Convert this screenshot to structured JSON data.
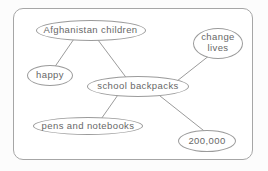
{
  "diagram": {
    "colors": {
      "card_background": "#ffffff",
      "card_border": "#a6a6a6",
      "node_border": "#9b9b9b",
      "edge_line": "#9b9b9b",
      "text": "#676767"
    },
    "nodes": [
      {
        "id": "afghanistan-children",
        "label": "Afghanistan children",
        "x": 90.5,
        "y": 30,
        "rx": 55,
        "ry": 10.5
      },
      {
        "id": "change-lives",
        "label": "change lives",
        "x": 218,
        "y": 43,
        "rx": 25,
        "ry": 15.5
      },
      {
        "id": "happy",
        "label": "happy",
        "x": 50,
        "y": 75,
        "rx": 23,
        "ry": 10.5
      },
      {
        "id": "school-backpacks",
        "label": "school backpacks",
        "x": 138,
        "y": 86.5,
        "rx": 51,
        "ry": 10.5
      },
      {
        "id": "pens-and-notebooks",
        "label": "pens and notebooks",
        "x": 88,
        "y": 126,
        "rx": 55,
        "ry": 9
      },
      {
        "id": "200000",
        "label": "200,000",
        "x": 207,
        "y": 141,
        "rx": 29,
        "ry": 11
      }
    ],
    "edges": [
      {
        "from": "afghanistan-children",
        "to": "happy",
        "x1": 76,
        "y1": 36,
        "x2": 54,
        "y2": 68
      },
      {
        "from": "afghanistan-children",
        "to": "school-backpacks",
        "x1": 95,
        "y1": 36,
        "x2": 128,
        "y2": 80
      },
      {
        "from": "school-backpacks",
        "to": "change-lives",
        "x1": 177,
        "y1": 81,
        "x2": 210,
        "y2": 55
      },
      {
        "from": "school-backpacks",
        "to": "pens-and-notebooks",
        "x1": 120,
        "y1": 92,
        "x2": 99,
        "y2": 122
      },
      {
        "from": "school-backpacks",
        "to": "200000",
        "x1": 155,
        "y1": 92,
        "x2": 208,
        "y2": 134
      }
    ]
  }
}
